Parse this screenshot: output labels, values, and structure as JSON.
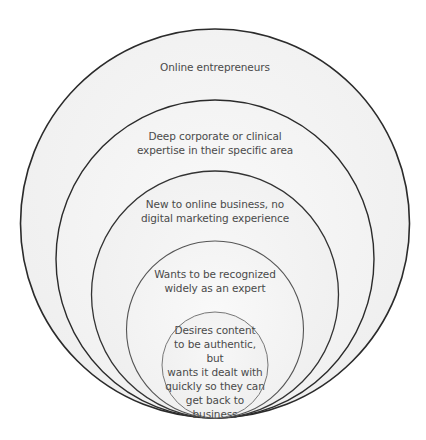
{
  "diagram": {
    "type": "nested-circles",
    "colors": {
      "background": "#ffffff",
      "fill_outer": "#f2f2f2",
      "fill_inner": "#f4f4f4",
      "stroke_outer": "#2b2b2b",
      "stroke_inner": "#555555",
      "text": "#4a4a4a"
    },
    "circles": [
      {
        "level": 1,
        "label": "Online entrepreneurs"
      },
      {
        "level": 2,
        "label": "Deep corporate or clinical expertise in their specific area",
        "lines": [
          "Deep corporate or clinical",
          "expertise in their specific area"
        ]
      },
      {
        "level": 3,
        "label": "New to online business, no digital marketing experience",
        "lines": [
          "New to online business, no",
          "digital marketing experience"
        ]
      },
      {
        "level": 4,
        "label": "Wants to be recognized widely as an expert",
        "lines": [
          "Wants to be recognized",
          "widely as an expert"
        ]
      },
      {
        "level": 5,
        "label": "Desires content to be authentic, but wants it dealt with quickly so they can get back to business",
        "lines": [
          "Desires content",
          "to be authentic, but",
          "wants it dealt with",
          "quickly so they can",
          "get back to",
          "business"
        ]
      }
    ]
  }
}
